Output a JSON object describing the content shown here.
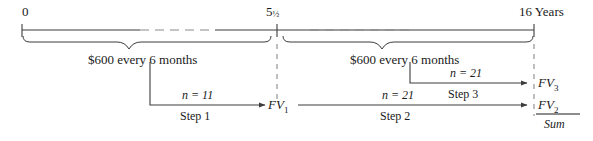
{
  "diagram": {
    "type": "financial-timeline",
    "axis": {
      "start_label": "0",
      "mid_label_whole": "5",
      "mid_label_fraction": "½",
      "end_label": "16 Years"
    },
    "braces": [
      {
        "id": "brace-left",
        "label": "$600 every 6 months"
      },
      {
        "id": "brace-right",
        "label": "$600 every 6 months"
      }
    ],
    "steps": [
      {
        "id": "step-1",
        "n_label": "n = 11",
        "name": "Step 1",
        "result": "FV",
        "result_sub": "1"
      },
      {
        "id": "step-2",
        "n_label": "n = 21",
        "name": "Step 2",
        "result": "FV",
        "result_sub": "2"
      },
      {
        "id": "step-3",
        "n_label": "n = 21",
        "name": "Step 3",
        "result": "FV",
        "result_sub": "3"
      }
    ],
    "sum_label": "Sum",
    "colors": {
      "line": "#3c3c3c",
      "dash": "#8a8a8a",
      "text": "#1a1a1a",
      "background": "#ffffff"
    }
  }
}
